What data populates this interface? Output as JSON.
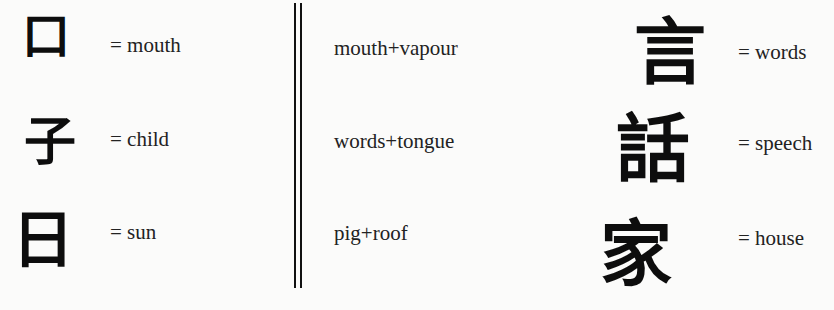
{
  "left": [
    {
      "char": "口",
      "meaning": "= mouth"
    },
    {
      "char": "子",
      "meaning": "= child"
    },
    {
      "char": "日",
      "meaning": "= sun"
    }
  ],
  "middle": [
    {
      "composition": "mouth+vapour"
    },
    {
      "composition": "words+tongue"
    },
    {
      "composition": "pig+roof"
    }
  ],
  "right": [
    {
      "char": "言",
      "meaning": "= words"
    },
    {
      "char": "話",
      "meaning": "= speech"
    },
    {
      "char": "家",
      "meaning": "= house"
    }
  ]
}
